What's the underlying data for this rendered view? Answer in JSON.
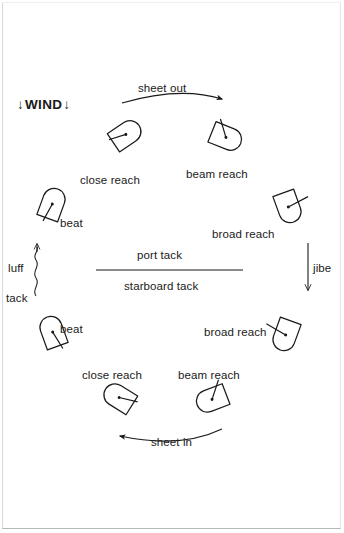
{
  "diagram": {
    "type": "points-of-sail-circle",
    "stroke_color": "#1a1a1a",
    "background_color": "#ffffff",
    "wind": {
      "label": "WIND",
      "direction": "down",
      "arrow_glyph": "↓",
      "arrow_count": 2
    },
    "tack_divider": {
      "upper_label": "port tack",
      "lower_label": "starboard tack"
    },
    "maneuvers": {
      "sheet_out": "sheet out",
      "sheet_in": "sheet in",
      "jibe": "jibe",
      "luff": "luff",
      "tack": "tack"
    },
    "boats": [
      {
        "id": "close-reach-port",
        "label": "close reach",
        "tack": "port",
        "heading_deg": 45,
        "x": 125,
        "y": 135,
        "label_x": 80,
        "label_y": 175
      },
      {
        "id": "beam-reach-port",
        "label": "beam reach",
        "tack": "port",
        "heading_deg": 90,
        "x": 225,
        "y": 135,
        "label_x": 186,
        "label_y": 169
      },
      {
        "id": "broad-reach-port",
        "label": "broad reach",
        "tack": "port",
        "heading_deg": 135,
        "x": 288,
        "y": 205,
        "label_x": 212,
        "label_y": 229
      },
      {
        "id": "broad-reach-stbd",
        "label": "broad reach",
        "tack": "starboard",
        "heading_deg": 225,
        "x": 285,
        "y": 333,
        "label_x": 204,
        "label_y": 327
      },
      {
        "id": "beam-reach-stbd",
        "label": "beam reach",
        "tack": "starboard",
        "heading_deg": 270,
        "x": 212,
        "y": 398,
        "label_x": 178,
        "label_y": 370
      },
      {
        "id": "close-reach-stbd",
        "label": "close reach",
        "tack": "starboard",
        "heading_deg": 315,
        "x": 118,
        "y": 398,
        "label_x": 82,
        "label_y": 370
      },
      {
        "id": "beat-stbd",
        "label": "beat",
        "tack": "starboard",
        "heading_deg": 340,
        "x": 52,
        "y": 333,
        "label_x": 60,
        "label_y": 324
      },
      {
        "id": "beat-port",
        "label": "beat",
        "tack": "port",
        "heading_deg": 20,
        "x": 52,
        "y": 205,
        "label_x": 60,
        "label_y": 218
      }
    ]
  }
}
